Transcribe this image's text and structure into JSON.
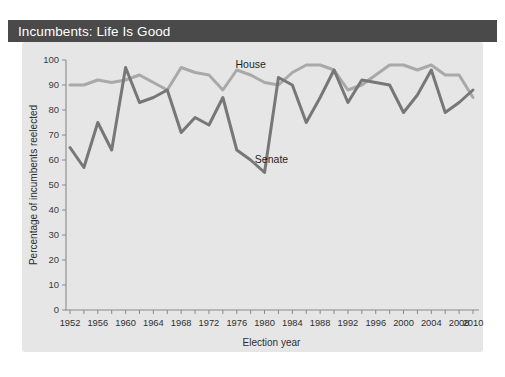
{
  "figure": {
    "title": "Incumbents: Life Is Good",
    "title_bar_color": "#4a4a4a",
    "panel_color": "#e6e6e6",
    "background_color": "#ffffff"
  },
  "chart_data": {
    "type": "line",
    "title": "Incumbents: Life Is Good",
    "xlabel": "Election year",
    "ylabel": "Percentage of incumbents reelected",
    "xlim": [
      1951,
      2011
    ],
    "ylim": [
      0,
      100
    ],
    "ytick_step": 10,
    "xtick_step_minor": 2,
    "xtick_step_major": 4,
    "grid": false,
    "legend_position": "inline-annotations",
    "yticks": [
      0,
      10,
      20,
      30,
      40,
      50,
      60,
      70,
      80,
      90,
      100
    ],
    "xticks_major": [
      1952,
      1956,
      1960,
      1964,
      1968,
      1972,
      1976,
      1980,
      1984,
      1988,
      1992,
      1996,
      2000,
      2004,
      2008,
      2010
    ],
    "xticks_all": [
      1952,
      1954,
      1956,
      1958,
      1960,
      1962,
      1964,
      1966,
      1968,
      1970,
      1972,
      1974,
      1976,
      1978,
      1980,
      1982,
      1984,
      1986,
      1988,
      1990,
      1992,
      1994,
      1996,
      1998,
      2000,
      2002,
      2004,
      2006,
      2008,
      2010
    ],
    "x": [
      1952,
      1954,
      1956,
      1958,
      1960,
      1962,
      1964,
      1966,
      1968,
      1970,
      1972,
      1974,
      1976,
      1978,
      1980,
      1982,
      1984,
      1986,
      1988,
      1990,
      1992,
      1994,
      1996,
      1998,
      2000,
      2002,
      2004,
      2006,
      2008,
      2010
    ],
    "series": [
      {
        "name": "House",
        "color": "#a9a9a9",
        "label_x": 1978,
        "label_y": 97,
        "values": [
          90,
          90,
          92,
          91,
          92,
          94,
          91,
          88,
          97,
          95,
          94,
          88,
          96,
          94,
          91,
          90,
          95,
          98,
          98,
          96,
          88,
          90,
          94,
          98,
          98,
          96,
          98,
          94,
          94,
          85
        ]
      },
      {
        "name": "Senate",
        "color": "#777777",
        "label_x": 1981,
        "label_y": 59,
        "values": [
          65,
          57,
          75,
          64,
          97,
          83,
          85,
          88,
          71,
          77,
          74,
          85,
          64,
          60,
          55,
          93,
          90,
          75,
          85,
          96,
          83,
          92,
          91,
          90,
          79,
          86,
          96,
          79,
          83,
          88
        ]
      }
    ],
    "annotations": [
      {
        "text": "House",
        "x": 1978,
        "y": 97
      },
      {
        "text": "Senate",
        "x": 1981,
        "y": 59
      }
    ]
  }
}
